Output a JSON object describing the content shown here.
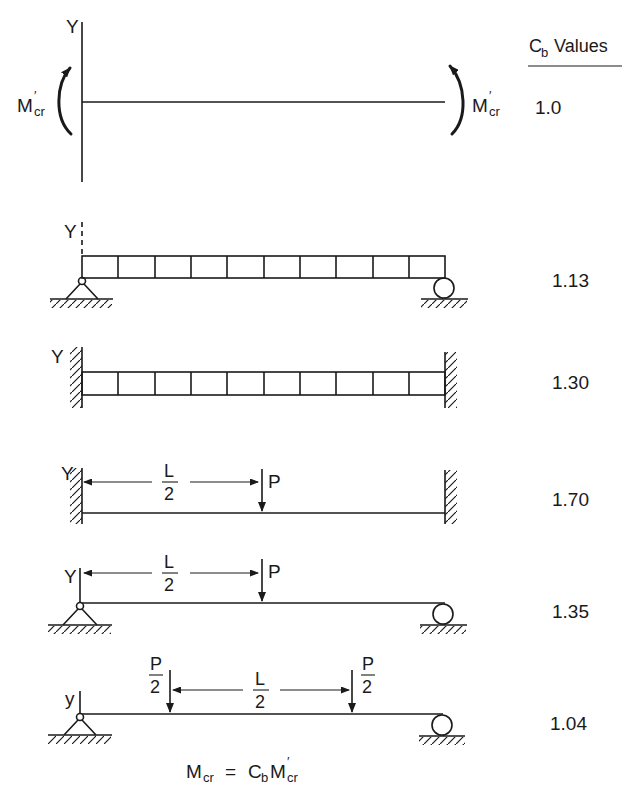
{
  "header": {
    "title_main": "C",
    "title_sub": "b",
    "title_rest": " Values"
  },
  "cases": [
    {
      "id": "uniform-moment",
      "axis_label": "Y",
      "moment_left": {
        "main": "M",
        "prime": "′",
        "sub": "cr"
      },
      "moment_right": {
        "main": "M",
        "prime": "′",
        "sub": "cr"
      },
      "cb_value": "1.0"
    },
    {
      "id": "simply-supported-uniform-load",
      "axis_label": "Y",
      "left_support": "pin",
      "right_support": "roller",
      "load": "uniform",
      "cb_value": "1.13"
    },
    {
      "id": "fixed-fixed-uniform-load",
      "axis_label": "Y",
      "left_support": "fixed",
      "right_support": "fixed",
      "load": "uniform",
      "cb_value": "1.30"
    },
    {
      "id": "fixed-fixed-midspan-point-load",
      "axis_label": "Y",
      "left_support": "fixed",
      "right_support": "fixed",
      "dim_num": "L",
      "dim_den": "2",
      "load_label": "P",
      "cb_value": "1.70"
    },
    {
      "id": "simply-supported-midspan-point-load",
      "axis_label": "Y",
      "left_support": "pin",
      "right_support": "roller",
      "dim_num": "L",
      "dim_den": "2",
      "load_label": "P",
      "cb_value": "1.35"
    },
    {
      "id": "simply-supported-two-point-loads",
      "axis_label": "y",
      "left_support": "pin",
      "right_support": "roller",
      "dim_num": "L",
      "dim_den": "2",
      "load_num": "P",
      "load_den": "2",
      "cb_value": "1.04"
    }
  ],
  "formula": {
    "lhs_main": "M",
    "lhs_sub": "cr",
    "eq": "=",
    "c_main": "C",
    "c_sub": "b",
    "m_main": "M",
    "m_prime": "′",
    "m_sub": "cr"
  }
}
